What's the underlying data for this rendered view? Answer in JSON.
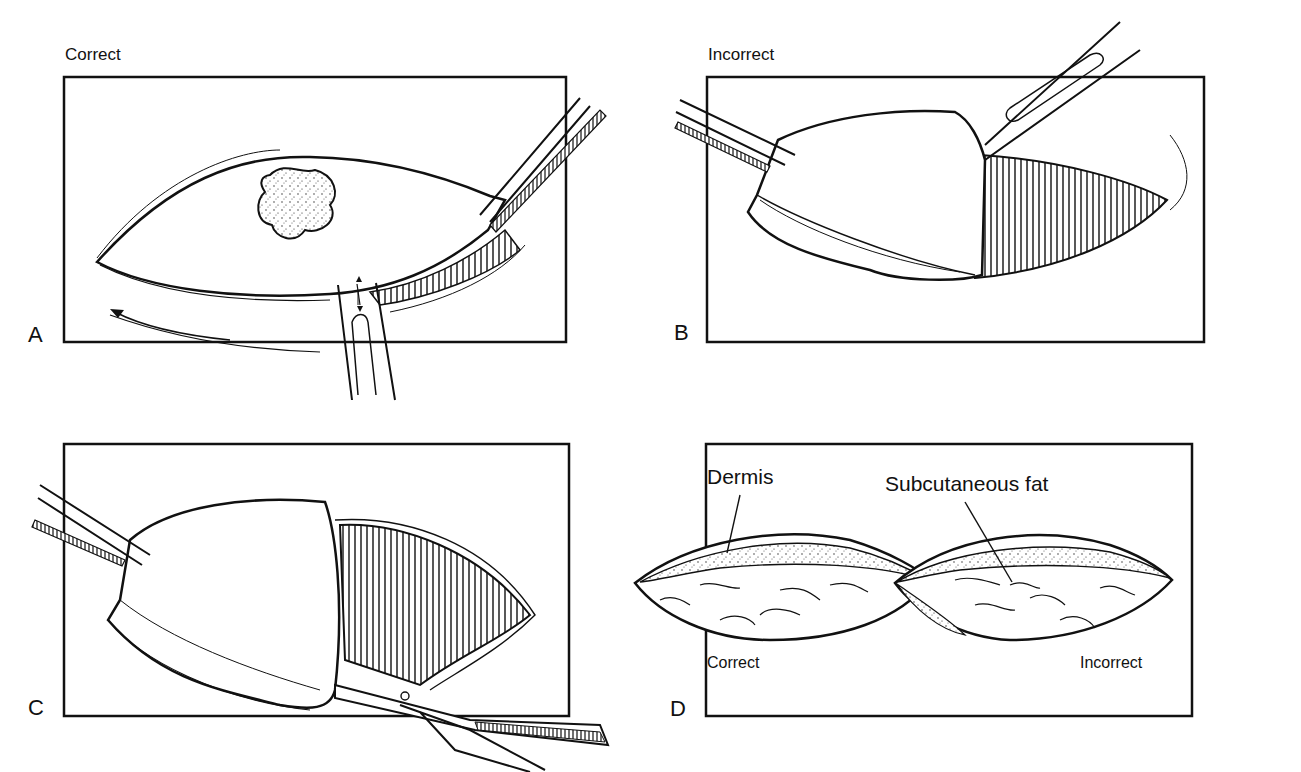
{
  "figure": {
    "panels": [
      {
        "id": "A",
        "letter": "A",
        "caption": "Correct"
      },
      {
        "id": "B",
        "letter": "B",
        "caption": "Incorrect"
      },
      {
        "id": "C",
        "letter": "C",
        "caption": ""
      },
      {
        "id": "D",
        "letter": "D",
        "caption": "",
        "annotations": {
          "dermis": "Dermis",
          "fat": "Subcutaneous fat"
        },
        "sublabels": {
          "left": "Correct",
          "right": "Incorrect"
        }
      }
    ],
    "colors": {
      "ink": "#111111",
      "background": "#ffffff"
    }
  }
}
